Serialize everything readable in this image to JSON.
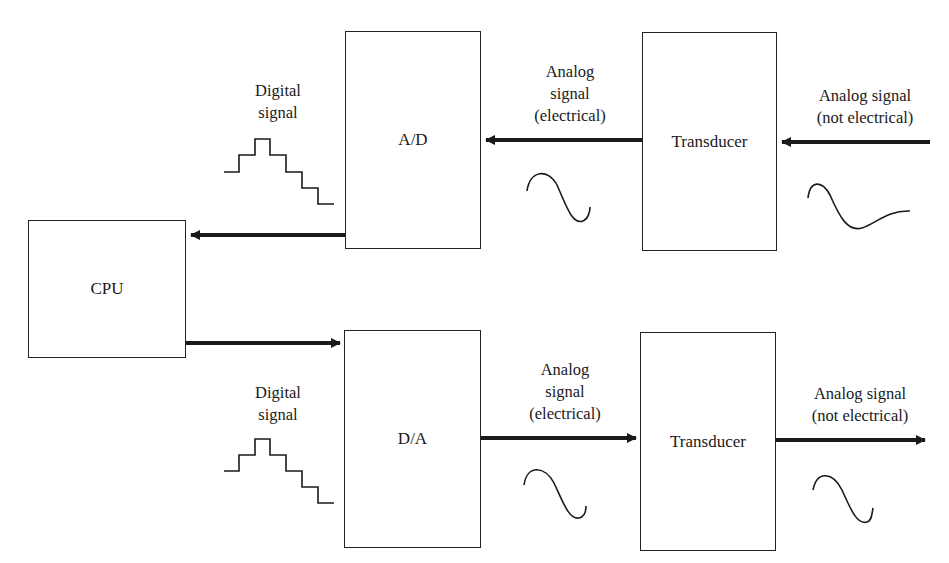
{
  "diagram": {
    "title": "",
    "blocks": {
      "cpu": "CPU",
      "ad": "A/D",
      "da": "D/A",
      "transducer_in": "Transducer",
      "transducer_out": "Transducer"
    },
    "labels": {
      "top_digital_1": "Digital",
      "top_digital_2": "signal",
      "top_analog_elec_1": "Analog",
      "top_analog_elec_2": "signal",
      "top_analog_elec_3": "(electrical)",
      "top_analog_nonelec_1": "Analog signal",
      "top_analog_nonelec_2": "(not electrical)",
      "bottom_digital_1": "Digital",
      "bottom_digital_2": "signal",
      "bottom_analog_elec_1": "Analog",
      "bottom_analog_elec_2": "signal",
      "bottom_analog_elec_3": "(electrical)",
      "bottom_analog_nonelec_1": "Analog signal",
      "bottom_analog_nonelec_2": "(not electrical)"
    },
    "edges": [
      {
        "from": "external input",
        "to": "transducer_in",
        "label": "Analog signal (not electrical)"
      },
      {
        "from": "transducer_in",
        "to": "ad",
        "label": "Analog signal (electrical)"
      },
      {
        "from": "ad",
        "to": "cpu",
        "label": "Digital signal"
      },
      {
        "from": "cpu",
        "to": "da",
        "label": "Digital signal"
      },
      {
        "from": "da",
        "to": "transducer_out",
        "label": "Analog signal (electrical)"
      },
      {
        "from": "transducer_out",
        "to": "external output",
        "label": "Analog signal (not electrical)"
      }
    ],
    "colors": {
      "stroke": "#222222",
      "background": "#ffffff"
    }
  }
}
